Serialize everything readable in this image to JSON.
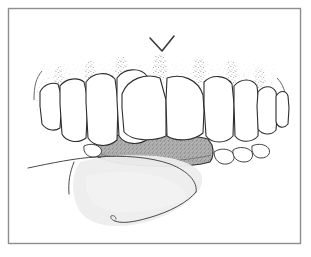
{
  "figure": {
    "title": "Lower anterior teeth with gingival stippling, plaque deposit and tongue",
    "caption": "",
    "domain": "anatomical line illustration",
    "background_color": "#ffffff"
  },
  "frame": {
    "name": "illustration-border",
    "x": 8,
    "y": 8,
    "width": 293,
    "height": 236,
    "stroke_color": "#8d8d8d",
    "stroke_width": 1.4,
    "fill": "#ffffff"
  },
  "annotations": {
    "pointer_mark": {
      "label": "V",
      "description": "V-shaped pointer indicating interdental gingiva",
      "x": 162,
      "y": 44,
      "color": "#3a3a3a"
    }
  },
  "anatomy": {
    "gingiva": {
      "label": "gingiva",
      "description": "stippled attached gum tissue above the teeth",
      "outline_color": "#4a4a4a",
      "stipple_color": "#6e6e6e",
      "fill": "#ffffff"
    },
    "teeth": {
      "label": "teeth",
      "count": 10,
      "outline_color": "#2e2e2e",
      "fill": "#ffffff",
      "crowns": [
        {
          "name": "tooth-left-molar",
          "position": "far-left"
        },
        {
          "name": "tooth-left-premolar",
          "position": "left"
        },
        {
          "name": "tooth-left-canine",
          "position": "left"
        },
        {
          "name": "tooth-left-lateral-incisor",
          "position": "left-center"
        },
        {
          "name": "tooth-left-central-incisor",
          "position": "center"
        },
        {
          "name": "tooth-right-central-incisor",
          "position": "center"
        },
        {
          "name": "tooth-right-lateral-incisor",
          "position": "right-center"
        },
        {
          "name": "tooth-right-canine",
          "position": "right"
        },
        {
          "name": "tooth-right-premolar",
          "position": "right"
        },
        {
          "name": "tooth-right-molar",
          "position": "far-right"
        }
      ]
    },
    "plaque_band": {
      "label": "plaque deposit",
      "description": "shaded calculus/plaque band along the cervical margins of the lower front teeth",
      "fill_color": "#a9a9a9",
      "outline_color": "#2e2e2e",
      "texture": "stipple"
    },
    "tongue": {
      "label": "tongue",
      "description": "tongue body filling the lower portion of the oral cavity",
      "fill_color": "#ededed",
      "outline_color": "#5a5a5a"
    }
  },
  "colors": {
    "ink": "#2e2e2e",
    "light_ink": "#6e6e6e",
    "frame": "#8d8d8d",
    "plaque": "#a9a9a9",
    "tongue": "#ededed",
    "paper": "#ffffff"
  }
}
